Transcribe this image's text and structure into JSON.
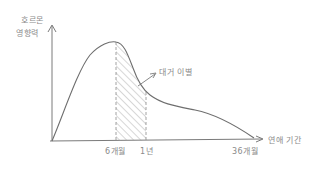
{
  "diagram": {
    "y_axis_label_line1": "호르몬",
    "y_axis_label_line2": "영향력",
    "x_axis_label": "연애 기간",
    "ticks": [
      {
        "label": "6개월"
      },
      {
        "label": "1년"
      },
      {
        "label": "36개월"
      }
    ],
    "annotation": "대거 이별",
    "colors": {
      "stroke": "#7a7a7a",
      "text": "#8a8a8a"
    }
  }
}
